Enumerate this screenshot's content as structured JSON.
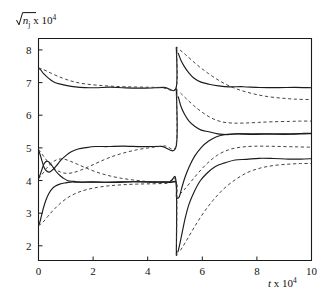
{
  "figure": {
    "ylabel_prefix": "√",
    "ylabel_var": "n",
    "ylabel_sub": "j",
    "ylabel_mult": " x 10",
    "ylabel_exp": "4",
    "xlabel_var": "t",
    "xlabel_mult": " x 10",
    "xlabel_exp": "4"
  },
  "chart_data": {
    "type": "line",
    "title": "",
    "xlabel": "t x 10^4",
    "ylabel": "sqrt(n_j) x 10^4",
    "xlim": [
      0,
      10
    ],
    "ylim": [
      1.55,
      8.35
    ],
    "xticks": [
      0,
      2,
      4,
      6,
      8,
      10
    ],
    "yticks": [
      2,
      3,
      4,
      5,
      6,
      7,
      8
    ],
    "xticklabels": [
      "0",
      "2",
      "4",
      "6",
      "8",
      "10"
    ],
    "yticklabels": [
      "2",
      "3",
      "4",
      "5",
      "6",
      "7",
      "8"
    ],
    "grid": false,
    "legend": null,
    "annotations": [
      {
        "text": "switching event (discontinuity)",
        "x": 5.05
      }
    ],
    "switch_x": 5.05,
    "series": [
      {
        "name": "mode-1-solid",
        "style": "solid",
        "points": [
          [
            0.0,
            7.45
          ],
          [
            0.08,
            7.38
          ],
          [
            0.18,
            7.28
          ],
          [
            0.3,
            7.18
          ],
          [
            0.45,
            7.08
          ],
          [
            0.62,
            7.0
          ],
          [
            0.82,
            6.94
          ],
          [
            1.05,
            6.9
          ],
          [
            1.35,
            6.87
          ],
          [
            1.7,
            6.86
          ],
          [
            2.1,
            6.85
          ],
          [
            2.6,
            6.85
          ],
          [
            3.2,
            6.85
          ],
          [
            3.9,
            6.84
          ],
          [
            4.6,
            6.85
          ],
          [
            5.04,
            6.85
          ],
          [
            5.05,
            8.08
          ],
          [
            5.12,
            7.9
          ],
          [
            5.22,
            7.68
          ],
          [
            5.35,
            7.48
          ],
          [
            5.5,
            7.3
          ],
          [
            5.7,
            7.14
          ],
          [
            5.95,
            7.02
          ],
          [
            6.25,
            6.95
          ],
          [
            6.6,
            6.9
          ],
          [
            7.0,
            6.87
          ],
          [
            7.5,
            6.86
          ],
          [
            8.1,
            6.85
          ],
          [
            8.8,
            6.85
          ],
          [
            9.4,
            6.85
          ],
          [
            10.0,
            6.85
          ]
        ]
      },
      {
        "name": "mode-1-dashed",
        "style": "dashed",
        "points": [
          [
            0.0,
            7.45
          ],
          [
            0.12,
            7.42
          ],
          [
            0.28,
            7.36
          ],
          [
            0.48,
            7.28
          ],
          [
            0.72,
            7.19
          ],
          [
            1.0,
            7.1
          ],
          [
            1.32,
            7.02
          ],
          [
            1.7,
            6.96
          ],
          [
            2.15,
            6.92
          ],
          [
            2.65,
            6.89
          ],
          [
            3.2,
            6.87
          ],
          [
            3.85,
            6.86
          ],
          [
            4.5,
            6.85
          ],
          [
            5.04,
            6.85
          ],
          [
            5.05,
            8.08
          ],
          [
            5.18,
            8.0
          ],
          [
            5.38,
            7.86
          ],
          [
            5.62,
            7.68
          ],
          [
            5.9,
            7.48
          ],
          [
            6.22,
            7.28
          ],
          [
            6.58,
            7.08
          ],
          [
            6.98,
            6.9
          ],
          [
            7.42,
            6.76
          ],
          [
            7.9,
            6.65
          ],
          [
            8.4,
            6.57
          ],
          [
            8.95,
            6.52
          ],
          [
            9.45,
            6.49
          ],
          [
            10.0,
            6.48
          ]
        ]
      },
      {
        "name": "mode-2-solid",
        "style": "solid",
        "points": [
          [
            0.0,
            4.95
          ],
          [
            0.06,
            4.78
          ],
          [
            0.13,
            4.58
          ],
          [
            0.21,
            4.4
          ],
          [
            0.3,
            4.28
          ],
          [
            0.4,
            4.25
          ],
          [
            0.52,
            4.32
          ],
          [
            0.66,
            4.46
          ],
          [
            0.82,
            4.62
          ],
          [
            1.0,
            4.77
          ],
          [
            1.2,
            4.89
          ],
          [
            1.45,
            4.97
          ],
          [
            1.75,
            5.02
          ],
          [
            2.1,
            5.04
          ],
          [
            2.55,
            5.05
          ],
          [
            3.1,
            5.05
          ],
          [
            3.8,
            5.05
          ],
          [
            4.5,
            5.05
          ],
          [
            5.04,
            5.05
          ],
          [
            5.05,
            6.8
          ],
          [
            5.12,
            6.55
          ],
          [
            5.22,
            6.28
          ],
          [
            5.35,
            6.03
          ],
          [
            5.52,
            5.82
          ],
          [
            5.72,
            5.66
          ],
          [
            5.96,
            5.55
          ],
          [
            6.24,
            5.48
          ],
          [
            6.56,
            5.44
          ],
          [
            6.92,
            5.42
          ],
          [
            7.35,
            5.42
          ],
          [
            7.85,
            5.42
          ],
          [
            8.4,
            5.42
          ],
          [
            9.0,
            5.43
          ],
          [
            9.55,
            5.44
          ],
          [
            10.0,
            5.44
          ]
        ]
      },
      {
        "name": "mode-2-dashed",
        "style": "dashed",
        "points": [
          [
            0.0,
            4.95
          ],
          [
            0.12,
            4.82
          ],
          [
            0.26,
            4.66
          ],
          [
            0.42,
            4.5
          ],
          [
            0.6,
            4.36
          ],
          [
            0.8,
            4.26
          ],
          [
            1.02,
            4.22
          ],
          [
            1.26,
            4.24
          ],
          [
            1.55,
            4.32
          ],
          [
            1.88,
            4.44
          ],
          [
            2.25,
            4.58
          ],
          [
            2.65,
            4.72
          ],
          [
            3.1,
            4.84
          ],
          [
            3.6,
            4.94
          ],
          [
            4.12,
            5.01
          ],
          [
            4.62,
            5.06
          ],
          [
            5.04,
            5.09
          ],
          [
            5.05,
            6.8
          ],
          [
            5.2,
            6.68
          ],
          [
            5.42,
            6.5
          ],
          [
            5.68,
            6.3
          ],
          [
            5.98,
            6.1
          ],
          [
            6.32,
            5.92
          ],
          [
            6.7,
            5.8
          ],
          [
            7.1,
            5.76
          ],
          [
            7.55,
            5.76
          ],
          [
            8.05,
            5.78
          ],
          [
            8.6,
            5.8
          ],
          [
            9.2,
            5.81
          ],
          [
            9.6,
            5.82
          ],
          [
            10.0,
            5.82
          ]
        ]
      },
      {
        "name": "mode-3-solid",
        "style": "solid",
        "points": [
          [
            0.0,
            4.05
          ],
          [
            0.06,
            4.18
          ],
          [
            0.12,
            4.34
          ],
          [
            0.2,
            4.5
          ],
          [
            0.29,
            4.58
          ],
          [
            0.38,
            4.56
          ],
          [
            0.48,
            4.46
          ],
          [
            0.6,
            4.32
          ],
          [
            0.74,
            4.18
          ],
          [
            0.9,
            4.07
          ],
          [
            1.08,
            4.0
          ],
          [
            1.3,
            3.96
          ],
          [
            1.58,
            3.95
          ],
          [
            1.95,
            3.95
          ],
          [
            2.4,
            3.95
          ],
          [
            2.95,
            3.95
          ],
          [
            3.55,
            3.95
          ],
          [
            4.2,
            3.95
          ],
          [
            4.8,
            3.95
          ],
          [
            5.04,
            3.95
          ],
          [
            5.05,
            3.52
          ],
          [
            5.1,
            3.46
          ],
          [
            5.16,
            3.52
          ],
          [
            5.24,
            3.75
          ],
          [
            5.36,
            4.08
          ],
          [
            5.52,
            4.42
          ],
          [
            5.72,
            4.74
          ],
          [
            5.96,
            5.0
          ],
          [
            6.22,
            5.2
          ],
          [
            6.52,
            5.33
          ],
          [
            6.85,
            5.4
          ],
          [
            7.22,
            5.42
          ],
          [
            7.65,
            5.42
          ],
          [
            8.15,
            5.42
          ],
          [
            8.7,
            5.42
          ],
          [
            9.25,
            5.43
          ],
          [
            9.7,
            5.44
          ],
          [
            10.0,
            5.44
          ]
        ]
      },
      {
        "name": "mode-3-dashed",
        "style": "dashed",
        "points": [
          [
            0.0,
            4.05
          ],
          [
            0.14,
            4.2
          ],
          [
            0.3,
            4.38
          ],
          [
            0.48,
            4.54
          ],
          [
            0.68,
            4.64
          ],
          [
            0.9,
            4.66
          ],
          [
            1.14,
            4.6
          ],
          [
            1.42,
            4.5
          ],
          [
            1.75,
            4.38
          ],
          [
            2.12,
            4.26
          ],
          [
            2.52,
            4.16
          ],
          [
            2.96,
            4.08
          ],
          [
            3.44,
            4.02
          ],
          [
            3.96,
            3.97
          ],
          [
            4.5,
            3.94
          ],
          [
            5.04,
            3.92
          ],
          [
            5.05,
            3.52
          ],
          [
            5.18,
            3.58
          ],
          [
            5.36,
            3.74
          ],
          [
            5.6,
            3.98
          ],
          [
            5.88,
            4.26
          ],
          [
            6.2,
            4.54
          ],
          [
            6.56,
            4.78
          ],
          [
            6.96,
            4.94
          ],
          [
            7.4,
            5.02
          ],
          [
            7.88,
            5.05
          ],
          [
            8.4,
            5.05
          ],
          [
            8.95,
            5.04
          ],
          [
            9.5,
            5.03
          ],
          [
            10.0,
            5.02
          ]
        ]
      },
      {
        "name": "mode-4-solid",
        "style": "solid",
        "points": [
          [
            0.0,
            2.62
          ],
          [
            0.05,
            2.72
          ],
          [
            0.11,
            2.92
          ],
          [
            0.18,
            3.16
          ],
          [
            0.27,
            3.4
          ],
          [
            0.37,
            3.58
          ],
          [
            0.48,
            3.72
          ],
          [
            0.62,
            3.83
          ],
          [
            0.78,
            3.9
          ],
          [
            0.96,
            3.93
          ],
          [
            1.18,
            3.95
          ],
          [
            1.45,
            3.95
          ],
          [
            1.8,
            3.95
          ],
          [
            2.25,
            3.95
          ],
          [
            2.8,
            3.95
          ],
          [
            3.45,
            3.95
          ],
          [
            4.15,
            3.95
          ],
          [
            4.8,
            3.95
          ],
          [
            5.04,
            3.95
          ],
          [
            5.05,
            1.72
          ],
          [
            5.11,
            1.82
          ],
          [
            5.18,
            2.08
          ],
          [
            5.27,
            2.44
          ],
          [
            5.38,
            2.86
          ],
          [
            5.52,
            3.28
          ],
          [
            5.7,
            3.66
          ],
          [
            5.92,
            3.98
          ],
          [
            6.18,
            4.24
          ],
          [
            6.48,
            4.42
          ],
          [
            6.82,
            4.54
          ],
          [
            7.2,
            4.62
          ],
          [
            7.62,
            4.66
          ],
          [
            8.08,
            4.68
          ],
          [
            8.6,
            4.68
          ],
          [
            9.15,
            4.67
          ],
          [
            9.6,
            4.66
          ],
          [
            10.0,
            4.66
          ]
        ]
      },
      {
        "name": "mode-4-dashed",
        "style": "dashed",
        "points": [
          [
            0.0,
            2.62
          ],
          [
            0.16,
            2.72
          ],
          [
            0.34,
            2.9
          ],
          [
            0.55,
            3.1
          ],
          [
            0.8,
            3.3
          ],
          [
            1.08,
            3.48
          ],
          [
            1.4,
            3.62
          ],
          [
            1.76,
            3.72
          ],
          [
            2.16,
            3.79
          ],
          [
            2.6,
            3.84
          ],
          [
            3.08,
            3.87
          ],
          [
            3.6,
            3.89
          ],
          [
            4.16,
            3.9
          ],
          [
            4.7,
            3.91
          ],
          [
            5.04,
            3.91
          ],
          [
            5.05,
            1.72
          ],
          [
            5.2,
            1.86
          ],
          [
            5.42,
            2.16
          ],
          [
            5.7,
            2.56
          ],
          [
            6.02,
            2.98
          ],
          [
            6.38,
            3.38
          ],
          [
            6.78,
            3.74
          ],
          [
            7.2,
            4.02
          ],
          [
            7.64,
            4.24
          ],
          [
            8.12,
            4.38
          ],
          [
            8.62,
            4.46
          ],
          [
            9.14,
            4.5
          ],
          [
            9.6,
            4.52
          ],
          [
            10.0,
            4.52
          ]
        ]
      }
    ]
  }
}
